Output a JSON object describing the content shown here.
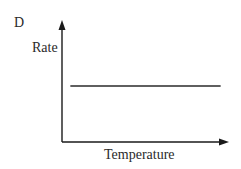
{
  "chart_data": {
    "type": "line",
    "panel_label": "D",
    "title": "",
    "xlabel": "Temperature",
    "ylabel": "Rate",
    "x_ticks": [],
    "y_ticks": [],
    "grid": false,
    "legend": null,
    "series": [
      {
        "name": "Rate",
        "description": "constant (horizontal line) — rate independent of temperature",
        "x": [
          0.05,
          0.95
        ],
        "y": [
          0.5,
          0.5
        ]
      }
    ],
    "axis_color": "#1a1a1a",
    "line_color": "#2a2a2a"
  }
}
